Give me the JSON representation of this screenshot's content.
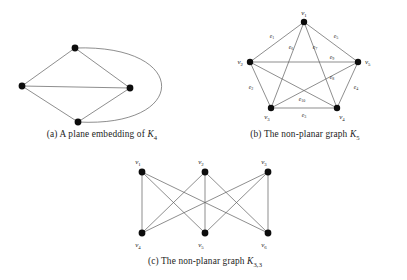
{
  "figure": {
    "panels": [
      {
        "id": "a",
        "tag": "(a)",
        "caption_text": "A plane embedding of",
        "caption_symbol": "K",
        "caption_symbol_sub": "4",
        "caption_full": "(a) A plane embedding of K4",
        "graph": {
          "name": "K4-plane-embedding",
          "type": "undirected-graph",
          "vertex_count": 4,
          "edge_count": 6,
          "planar": true,
          "vertices": [
            {
              "id": "a1",
              "x": 75,
              "y": 48,
              "label": ""
            },
            {
              "id": "a2",
              "x": 22,
              "y": 86,
              "label": ""
            },
            {
              "id": "a3",
              "x": 130,
              "y": 88,
              "label": ""
            },
            {
              "id": "a4",
              "x": 78,
              "y": 122,
              "label": ""
            }
          ],
          "straight_edges": [
            [
              "a1",
              "a2"
            ],
            [
              "a1",
              "a3"
            ],
            [
              "a2",
              "a3"
            ],
            [
              "a2",
              "a4"
            ],
            [
              "a3",
              "a4"
            ]
          ],
          "curved_edges": [
            {
              "from": "a1",
              "to": "a4",
              "control1_x": 190,
              "control1_y": 44,
              "control2_x": 190,
              "control2_y": 128
            }
          ]
        }
      },
      {
        "id": "b",
        "tag": "(b)",
        "caption_text": "The non-planar graph",
        "caption_symbol": "K",
        "caption_symbol_sub": "5",
        "caption_full": "(b) The non-planar graph K5",
        "graph": {
          "name": "K5-complete-graph",
          "type": "undirected-graph",
          "vertex_count": 5,
          "edge_count": 10,
          "planar": false,
          "vertices": [
            {
              "id": "v1",
              "x": 101,
              "y": 22,
              "label": "v",
              "sub": "1",
              "lx": 101,
              "ly": 15,
              "anchor": "middle"
            },
            {
              "id": "v2",
              "x": 47,
              "y": 62,
              "label": "v",
              "sub": "2",
              "lx": 40,
              "ly": 64,
              "anchor": "end"
            },
            {
              "id": "v3",
              "x": 68,
              "y": 108,
              "label": "v",
              "sub": "3",
              "lx": 64,
              "ly": 117,
              "anchor": "middle"
            },
            {
              "id": "v4",
              "x": 134,
              "y": 108,
              "label": "v",
              "sub": "4",
              "lx": 139,
              "ly": 117,
              "anchor": "middle"
            },
            {
              "id": "v5",
              "x": 155,
              "y": 62,
              "label": "v",
              "sub": "5",
              "lx": 162,
              "ly": 64,
              "anchor": "start"
            }
          ],
          "edges": [
            {
              "id": "e1",
              "label": "e",
              "sub": "1",
              "from": "v1",
              "to": "v2",
              "lx": 69,
              "ly": 38
            },
            {
              "id": "e2",
              "label": "e",
              "sub": "2",
              "from": "v2",
              "to": "v3",
              "lx": 48,
              "ly": 89
            },
            {
              "id": "e3",
              "label": "e",
              "sub": "3",
              "from": "v3",
              "to": "v4",
              "lx": 101,
              "ly": 116
            },
            {
              "id": "e4",
              "label": "e",
              "sub": "4",
              "from": "v4",
              "to": "v5",
              "lx": 153,
              "ly": 89
            },
            {
              "id": "e5",
              "label": "e",
              "sub": "5",
              "from": "v5",
              "to": "v1",
              "lx": 133,
              "ly": 38
            },
            {
              "id": "e6",
              "label": "e",
              "sub": "6",
              "from": "v1",
              "to": "v3",
              "lx": 89,
              "ly": 48
            },
            {
              "id": "e7",
              "label": "e",
              "sub": "7",
              "from": "v1",
              "to": "v4",
              "lx": 113,
              "ly": 48
            },
            {
              "id": "e8",
              "label": "e",
              "sub": "8",
              "from": "v2",
              "to": "v4",
              "lx": 128,
              "ly": 78
            },
            {
              "id": "e9",
              "label": "e",
              "sub": "9",
              "from": "v2",
              "to": "v5",
              "lx": 128,
              "ly": 62
            },
            {
              "id": "e10",
              "label": "e",
              "sub": "10",
              "from": "v3",
              "to": "v5",
              "lx": 97,
              "ly": 100
            }
          ]
        }
      },
      {
        "id": "c",
        "tag": "(c)",
        "caption_text": "The non-planar graph",
        "caption_symbol": "K",
        "caption_symbol_sub": "3,3",
        "caption_full": "(c) The non-planar graph K3,3",
        "graph": {
          "name": "K33-complete-bipartite-graph",
          "type": "bipartite-graph",
          "vertex_count": 6,
          "edge_count": 9,
          "planar": false,
          "vertices": [
            {
              "id": "v1",
              "x": 57,
              "y": 22,
              "label": "v",
              "sub": "1",
              "lx": 52,
              "ly": 14,
              "anchor": "middle"
            },
            {
              "id": "v2",
              "x": 120,
              "y": 22,
              "label": "v",
              "sub": "2",
              "lx": 115,
              "ly": 14,
              "anchor": "middle"
            },
            {
              "id": "v3",
              "x": 183,
              "y": 22,
              "label": "v",
              "sub": "3",
              "lx": 178,
              "ly": 14,
              "anchor": "middle"
            },
            {
              "id": "v4",
              "x": 57,
              "y": 83,
              "label": "v",
              "sub": "4",
              "lx": 52,
              "ly": 96,
              "anchor": "middle"
            },
            {
              "id": "v5",
              "x": 120,
              "y": 83,
              "label": "v",
              "sub": "5",
              "lx": 115,
              "ly": 96,
              "anchor": "middle"
            },
            {
              "id": "v6",
              "x": 183,
              "y": 83,
              "label": "v",
              "sub": "6",
              "lx": 178,
              "ly": 96,
              "anchor": "middle"
            }
          ],
          "edges": [
            [
              "v1",
              "v4"
            ],
            [
              "v1",
              "v5"
            ],
            [
              "v1",
              "v6"
            ],
            [
              "v2",
              "v4"
            ],
            [
              "v2",
              "v5"
            ],
            [
              "v2",
              "v6"
            ],
            [
              "v3",
              "v4"
            ],
            [
              "v3",
              "v5"
            ],
            [
              "v3",
              "v6"
            ]
          ]
        }
      }
    ],
    "style": {
      "background": "#ffffff",
      "edge_color": "#5d5d5d",
      "vertex_color": "#0d0d0d",
      "text_color": "#1a1a1a"
    }
  }
}
